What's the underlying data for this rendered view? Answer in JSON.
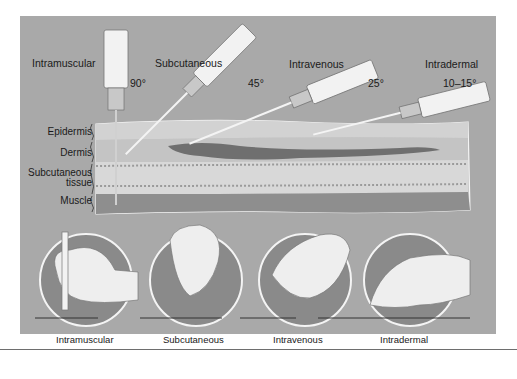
{
  "figure": {
    "top_labels": [
      {
        "name": "Intramuscular",
        "angle": "90°"
      },
      {
        "name": "Subcutaneous",
        "angle": "45°"
      },
      {
        "name": "Intravenous",
        "angle": "25°"
      },
      {
        "name": "Intradermal",
        "angle": "10–15°"
      }
    ],
    "skin_layers": [
      "Epidermis",
      "Dermis",
      "Subcutaneous tissue_line1",
      "Muscle"
    ],
    "layer_labels": {
      "epidermis": "Epidermis",
      "dermis": "Dermis",
      "subcutaneous_line1": "Subcutaneous",
      "subcutaneous_line2": "tissue",
      "muscle": "Muscle"
    },
    "bottom_labels": [
      "Intramuscular",
      "Subcutaneous",
      "Intravenous",
      "Intradermal"
    ],
    "colors": {
      "background": "#a9a9a9",
      "skin_light": "#d4d4d4",
      "vein": "#6f6f6f",
      "muscle": "#8e8e8e",
      "circle_fill": "#8a8a8a",
      "syringe": "#f2f2f2"
    }
  }
}
